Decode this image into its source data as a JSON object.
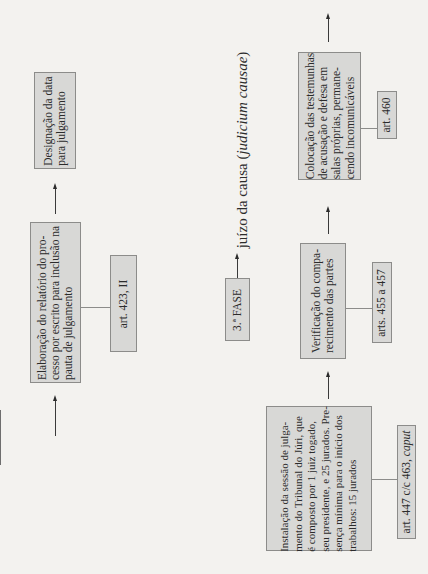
{
  "header": {
    "phase_label": "3.ª FASE",
    "phase_title_main": "juízo da causa (",
    "phase_title_italic": "judicium causae",
    "phase_title_close": ")"
  },
  "left_column": {
    "designacao": {
      "lines": [
        "Designação da data",
        "para julgamento"
      ]
    },
    "elaboracao": {
      "lines": [
        "Elaboração do relatório do pro-",
        "cesso por escrito para inclusão na",
        "pauta de julgamento"
      ]
    },
    "elaboracao_ref": "art. 423, II"
  },
  "right_column": {
    "colocacao": {
      "lines": [
        "Colocação das testemunhas",
        "de acusação e defesa em",
        "salas próprias, permane-",
        "cendo incomunicáveis"
      ]
    },
    "colocacao_ref": "art. 460",
    "verificacao": {
      "lines": [
        "Verificação do compa-",
        "recimento das partes"
      ]
    },
    "verificacao_ref": "arts. 455 a 457",
    "instalacao": {
      "lines": [
        "Instalação da sessão de julga-",
        "mento do Tribunal do Júri, que",
        "é composto por 1 juiz togado,",
        "seu presidente, e 25 jurados. Pre-",
        "sença mínima para o início dos",
        "trabalhos: 15 jurados"
      ]
    },
    "instalacao_ref_main": "art. 447 c/c 463, ",
    "instalacao_ref_italic": "caput"
  },
  "colors": {
    "background": "#f3f2ef",
    "box_fill": "#d8d8d6",
    "box_border": "#8c8c8a",
    "text": "#2b2b2b"
  }
}
